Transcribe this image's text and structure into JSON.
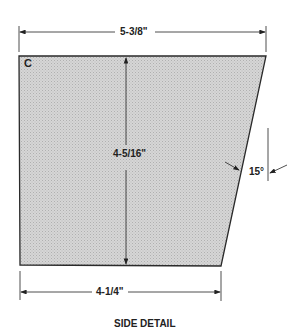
{
  "diagram": {
    "part_label": "C",
    "dimensions": {
      "top_width": "5-3/8\"",
      "bottom_width": "4-1/4\"",
      "height": "4-5/16\"",
      "angle": "15°"
    },
    "caption": "SIDE DETAIL",
    "colors": {
      "fill": "#cfcfcf",
      "stroke": "#2a2a2a"
    }
  }
}
